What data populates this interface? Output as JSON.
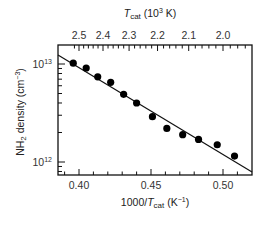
{
  "chart_data": {
    "type": "scatter",
    "title": "",
    "xlabel": "1000/T_cat (K^-1)",
    "ylabel": "NH2 density (cm^-3)",
    "top_xlabel": "T_cat (10^3 K)",
    "xlim": [
      0.385,
      0.52
    ],
    "ylim": [
      850000000000.0,
      13000000000000.0
    ],
    "yscale": "log",
    "grid": false,
    "legend": null,
    "x_ticks": [
      0.4,
      0.45,
      0.5
    ],
    "x_tick_labels": [
      "0.40",
      "0.45",
      "0.50"
    ],
    "top_ticks": [
      2.5,
      2.4,
      2.3,
      2.2,
      2.1,
      2.0
    ],
    "top_tick_labels": [
      "2.5",
      "2.4",
      "2.3",
      "2.2",
      "2.1",
      "2.0"
    ],
    "y_ticks": [
      1000000000000.0,
      10000000000000.0
    ],
    "y_tick_labels": [
      "10^12",
      "10^13"
    ],
    "series": [
      {
        "name": "NH2 density (measured)",
        "marker": "filled-circle",
        "x": [
          0.396,
          0.405,
          0.413,
          0.422,
          0.431,
          0.44,
          0.451,
          0.461,
          0.472,
          0.483,
          0.496,
          0.508
        ],
        "y": [
          10200000000000.0,
          9100000000000.0,
          7400000000000.0,
          6500000000000.0,
          4900000000000.0,
          4000000000000.0,
          2900000000000.0,
          2200000000000.0,
          1900000000000.0,
          1700000000000.0,
          1500000000000.0,
          1150000000000.0
        ]
      },
      {
        "name": "Arrhenius fit",
        "style": "line",
        "x": [
          0.385,
          0.52
        ],
        "y": [
          13000000000000.0,
          840000000000.0
        ]
      }
    ]
  },
  "labels": {
    "top_axis_T": "T",
    "top_axis_sub": "cat",
    "top_axis_rest": " (10",
    "top_axis_sup": "3",
    "top_axis_end": " K)",
    "x_axis_main": "1000/",
    "x_axis_T": "T",
    "x_axis_sub": "cat",
    "x_axis_rest": " (K",
    "x_axis_sup": "−1",
    "x_axis_end": ")",
    "y_axis_main": "NH",
    "y_axis_sub": "2",
    "y_axis_rest": " density (cm",
    "y_axis_sup": "−3",
    "y_axis_end": ")",
    "y_tick_1e13_base": "10",
    "y_tick_1e13_exp": "13",
    "y_tick_1e12_base": "10",
    "y_tick_1e12_exp": "12"
  }
}
